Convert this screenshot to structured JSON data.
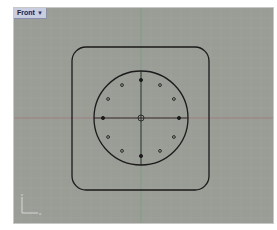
{
  "viewport": {
    "name": "Front",
    "menu_icon": "dropdown-arrow-icon",
    "background": "#9a9c96",
    "grid_color": "#a3a59f",
    "axis_x_color": "#9b7f7f",
    "axis_y_color": "#7f9b83",
    "curve_color": "#1a1a1a",
    "axes_widget": {
      "x_label": "x",
      "y_label": "z"
    }
  },
  "geometry": {
    "rounded_rect": {
      "x": 58,
      "y": 39,
      "w": 137,
      "h": 143,
      "r": 14
    },
    "circle": {
      "cx": 127,
      "cy": 110,
      "r": 47
    },
    "bolt_circle_radius": 38,
    "bolt_hole_count": 12,
    "center_mark_radius": 3
  }
}
